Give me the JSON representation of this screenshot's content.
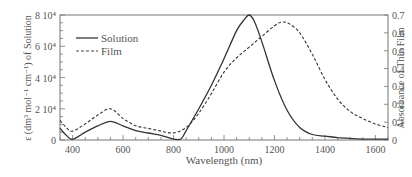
{
  "chart_data": {
    "type": "line",
    "title": "",
    "xlabel": "Wavelength (nm)",
    "ylabel": "ε (dm³ mol⁻¹ cm⁻¹) of Solution",
    "y2label": "Absorbance of Thin Film",
    "xlim": [
      350,
      1650
    ],
    "ylim": [
      0,
      80000
    ],
    "y2lim": [
      0,
      0.7
    ],
    "xticks": [
      400,
      600,
      800,
      1000,
      1200,
      1400,
      1600
    ],
    "yticks": [
      "0",
      "2 10⁴",
      "4 10⁴",
      "6 10⁴",
      "8 10⁴"
    ],
    "y2ticks": [
      "0",
      "0.1",
      "0.2",
      "0.3",
      "0.4",
      "0.5",
      "0.6",
      "0.7"
    ],
    "legend": {
      "position": "upper-left",
      "entries": [
        "Solution",
        "Film"
      ]
    },
    "grid": false,
    "series": [
      {
        "name": "Solution",
        "axis": "left",
        "style": "solid",
        "x": [
          350,
          375,
          400,
          450,
          500,
          550,
          600,
          650,
          700,
          750,
          800,
          830,
          850,
          900,
          950,
          1000,
          1050,
          1080,
          1100,
          1120,
          1150,
          1200,
          1250,
          1300,
          1350,
          1400,
          1450,
          1500,
          1550,
          1650
        ],
        "values": [
          7500,
          3000,
          500,
          5000,
          9000,
          12000,
          9000,
          6000,
          4500,
          3000,
          500,
          800,
          6000,
          20000,
          35000,
          52000,
          70000,
          77000,
          80000,
          76000,
          63000,
          38000,
          19000,
          8000,
          3500,
          2500,
          1500,
          1000,
          600,
          500
        ]
      },
      {
        "name": "Film",
        "axis": "right",
        "style": "dashed",
        "x": [
          350,
          375,
          400,
          450,
          500,
          550,
          600,
          650,
          700,
          750,
          800,
          850,
          900,
          950,
          1000,
          1050,
          1100,
          1150,
          1200,
          1230,
          1260,
          1300,
          1350,
          1400,
          1450,
          1500,
          1550,
          1600,
          1650
        ],
        "values": [
          0.11,
          0.07,
          0.05,
          0.09,
          0.14,
          0.175,
          0.12,
          0.08,
          0.065,
          0.05,
          0.04,
          0.07,
          0.15,
          0.26,
          0.38,
          0.46,
          0.52,
          0.58,
          0.64,
          0.66,
          0.65,
          0.6,
          0.48,
          0.34,
          0.23,
          0.16,
          0.12,
          0.09,
          0.07
        ]
      }
    ]
  },
  "colors": {
    "axis": "#666666",
    "line": "#333333",
    "text": "#555555"
  }
}
